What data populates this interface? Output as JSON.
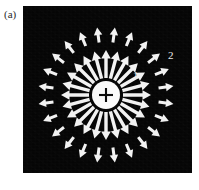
{
  "figure": {
    "panel_label": "(a)",
    "background_color": "#ffffff",
    "panel_color": "#050505",
    "arrow_color": "#f2f2f2",
    "charge_color": "#fafafa",
    "panel": {
      "x": 23,
      "y": 6,
      "width": 169,
      "height": 167
    }
  },
  "charge": {
    "name": "point-charge",
    "sign": "+",
    "center_x": 83,
    "center_y": 89,
    "radius": 14
  },
  "labels": [
    {
      "text": "1",
      "x": 110,
      "y": 73
    },
    {
      "text": "2",
      "x": 145,
      "y": 53
    }
  ],
  "chart_data": {
    "type": "vector-field",
    "title": "",
    "center": {
      "x": 83,
      "y": 89
    },
    "rings": [
      {
        "name": "inner-ring",
        "label": "1",
        "count": 24,
        "angle_step_deg": 15,
        "angle_offset_deg": 0,
        "r_start": 17,
        "r_end": 45,
        "shaft_width": 3.4,
        "head_length": 8.5,
        "head_width": 9.5
      },
      {
        "name": "outer-ring",
        "label": "2",
        "count": 24,
        "angle_step_deg": 15,
        "angle_offset_deg": 7.5,
        "r_start": 53,
        "r_end": 68,
        "shaft_width": 3.0,
        "head_length": 7.5,
        "head_width": 8.5
      }
    ],
    "direction": "outward",
    "xlabel": "",
    "ylabel": "",
    "legend": []
  }
}
